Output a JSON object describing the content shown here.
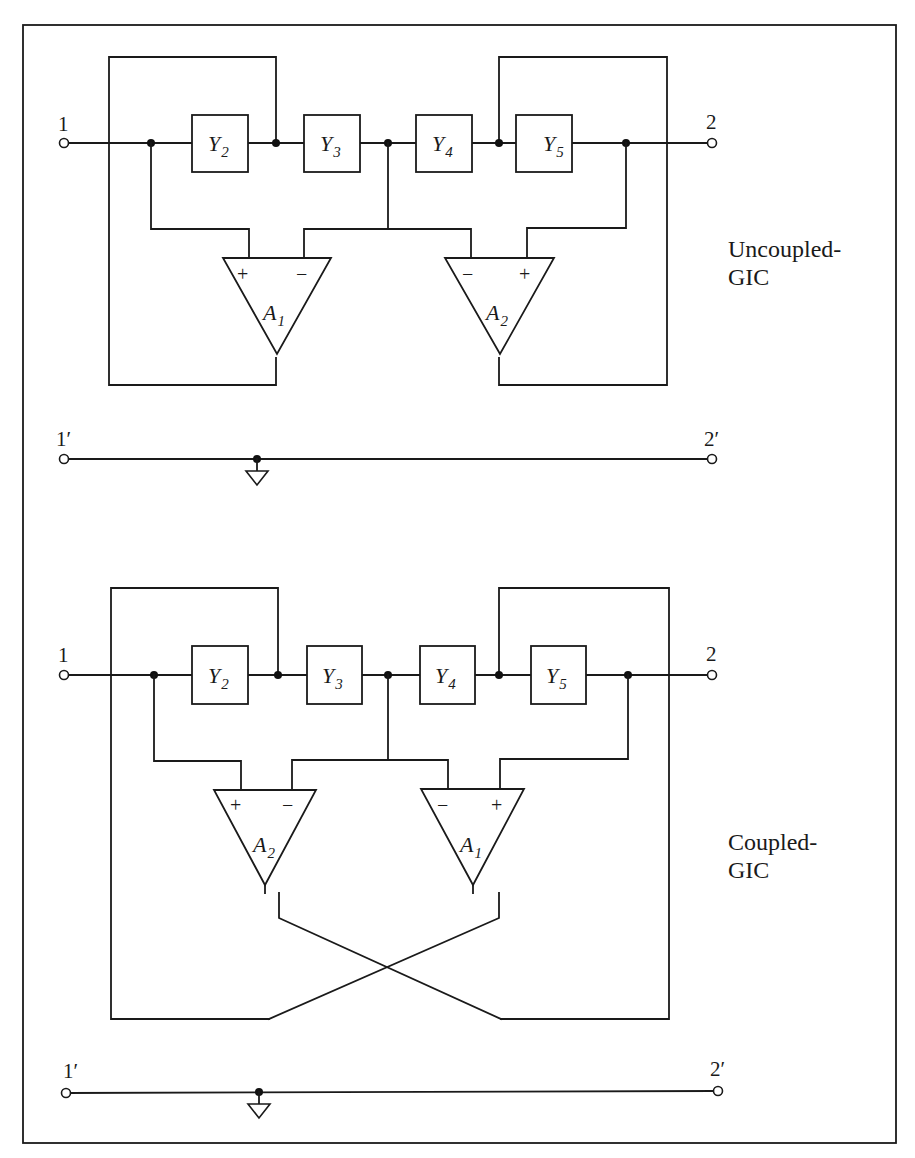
{
  "figure": {
    "border": {
      "x": 23,
      "y": 25,
      "w": 873,
      "h": 1118
    },
    "colors": {
      "ink": "#1a1a1a",
      "background": "#ffffff"
    }
  },
  "circuits": [
    {
      "id": "uncoupled",
      "label_line1": "Uncoupled-",
      "label_line2": "GIC",
      "label_pos": {
        "x": 728,
        "y": 257
      },
      "y_offset": 0,
      "amp_left": {
        "name": "A",
        "sub": "1"
      },
      "amp_right": {
        "name": "A",
        "sub": "2"
      },
      "coupled": false,
      "terminals": {
        "in": "1",
        "out": "2",
        "in_ref": "1′",
        "out_ref": "2′"
      }
    },
    {
      "id": "coupled",
      "label_line1": "Coupled-",
      "label_line2": "GIC",
      "label_pos": {
        "x": 728,
        "y": 850
      },
      "y_offset": 594,
      "amp_left": {
        "name": "A",
        "sub": "2"
      },
      "amp_right": {
        "name": "A",
        "sub": "1"
      },
      "coupled": true,
      "terminals": {
        "in": "1",
        "out": "2",
        "in_ref": "1′",
        "out_ref": "2′"
      }
    }
  ],
  "admittances": [
    {
      "name": "Y",
      "sub": "2"
    },
    {
      "name": "Y",
      "sub": "3"
    },
    {
      "name": "Y",
      "sub": "4"
    },
    {
      "name": "Y",
      "sub": "5"
    }
  ],
  "signs": {
    "plus": "+",
    "minus": "−"
  }
}
